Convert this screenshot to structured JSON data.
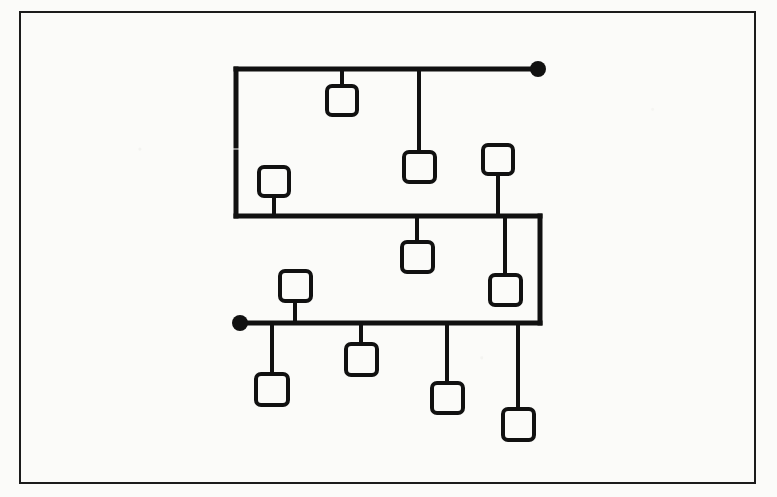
{
  "page": {
    "kind": "scanned-line-diagram",
    "background_color": "#fbfbf9",
    "ink_color": "#111111",
    "width": 777,
    "height": 497
  },
  "frame": {
    "label": "figure-border",
    "x": 20,
    "y": 12,
    "width": 735,
    "height": 471,
    "stroke_width": 2,
    "color": "#1b1b1b"
  },
  "diagram": {
    "title": "",
    "stroke_width_bus": 5,
    "stroke_width_stem": 4,
    "stroke_width_node": 4,
    "node_fill": "#fbfbf9",
    "node_corner_radius": 5,
    "terminals": [
      {
        "name": "terminal-top-right",
        "x": 538,
        "y": 69,
        "radius": 8,
        "fill": "#111111"
      },
      {
        "name": "terminal-bottom-left",
        "x": 240,
        "y": 323,
        "radius": 8,
        "fill": "#111111"
      }
    ],
    "buses": [
      {
        "name": "bus-top",
        "x1": 236,
        "y1": 69,
        "x2": 534,
        "y2": 69
      },
      {
        "name": "bus-middle",
        "x1": 236,
        "y1": 216,
        "x2": 540,
        "y2": 216
      },
      {
        "name": "bus-bottom",
        "x1": 244,
        "y1": 323,
        "x2": 540,
        "y2": 323
      }
    ],
    "risers": [
      {
        "name": "riser-left-upper",
        "x1": 236,
        "y1": 69,
        "x2": 236,
        "y2": 146
      },
      {
        "name": "riser-left-lower",
        "x1": 236,
        "y1": 152,
        "x2": 236,
        "y2": 216
      },
      {
        "name": "riser-right",
        "x1": 540,
        "y1": 216,
        "x2": 540,
        "y2": 323
      }
    ],
    "nodes": [
      {
        "name": "node-top-1",
        "x": 327,
        "y": 86,
        "width": 30,
        "height": 29,
        "stem": {
          "from_y": 69,
          "to_y": 86,
          "x": 342
        }
      },
      {
        "name": "node-top-2",
        "x": 404,
        "y": 152,
        "width": 31,
        "height": 30,
        "stem": {
          "from_y": 69,
          "to_y": 152,
          "x": 419
        }
      },
      {
        "name": "node-mid-left",
        "x": 259,
        "y": 167,
        "width": 30,
        "height": 29,
        "stem": {
          "from_y": 196,
          "to_y": 216,
          "x": 274
        }
      },
      {
        "name": "node-mid-above-right",
        "x": 483,
        "y": 145,
        "width": 30,
        "height": 29,
        "stem": {
          "from_y": 174,
          "to_y": 216,
          "x": 498
        }
      },
      {
        "name": "node-mid-below-center",
        "x": 402,
        "y": 242,
        "width": 31,
        "height": 30,
        "stem": {
          "from_y": 216,
          "to_y": 242,
          "x": 417
        }
      },
      {
        "name": "node-mid-below-right",
        "x": 490,
        "y": 275,
        "width": 31,
        "height": 30,
        "stem": {
          "from_y": 216,
          "to_y": 275,
          "x": 505
        }
      },
      {
        "name": "node-bottom-above",
        "x": 280,
        "y": 271,
        "width": 31,
        "height": 30,
        "stem": {
          "from_y": 301,
          "to_y": 323,
          "x": 295
        }
      },
      {
        "name": "node-bottom-1",
        "x": 256,
        "y": 374,
        "width": 32,
        "height": 31,
        "stem": {
          "from_y": 323,
          "to_y": 374,
          "x": 272
        }
      },
      {
        "name": "node-bottom-2",
        "x": 346,
        "y": 344,
        "width": 31,
        "height": 31,
        "stem": {
          "from_y": 323,
          "to_y": 344,
          "x": 361
        }
      },
      {
        "name": "node-bottom-3",
        "x": 432,
        "y": 383,
        "width": 31,
        "height": 30,
        "stem": {
          "from_y": 323,
          "to_y": 383,
          "x": 447
        }
      },
      {
        "name": "node-bottom-4",
        "x": 503,
        "y": 409,
        "width": 31,
        "height": 31,
        "stem": {
          "from_y": 323,
          "to_y": 409,
          "x": 518
        }
      }
    ]
  },
  "artifacts": {
    "ghost_line_top": "",
    "ghost_line_bottom": ""
  }
}
